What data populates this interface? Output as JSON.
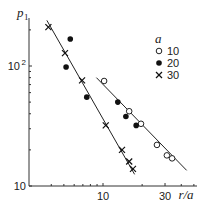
{
  "chart_data": {
    "type": "scatter",
    "title": "",
    "xlabel": "r/a",
    "ylabel": "p1",
    "xscale": "log",
    "yscale": "log",
    "xlim": [
      3.5,
      55
    ],
    "ylim": [
      10,
      250
    ],
    "x_ticks": [
      {
        "value": 10,
        "label": "10"
      },
      {
        "value": 30,
        "label": "30"
      }
    ],
    "x_minor_ticks": [
      4,
      5,
      6,
      7,
      8,
      9,
      20,
      40,
      50
    ],
    "y_ticks": [
      {
        "value": 10,
        "label": "10"
      },
      {
        "value": 100,
        "label": "10",
        "sup": "2"
      }
    ],
    "y_minor_ticks": [
      20,
      30,
      40,
      50,
      60,
      70,
      80,
      90,
      200
    ],
    "grid": false,
    "legend": {
      "title": "a",
      "position": "upper right",
      "entries": [
        {
          "label": "10",
          "marker": "open-circle"
        },
        {
          "label": "20",
          "marker": "filled-circle"
        },
        {
          "label": "30",
          "marker": "cross"
        }
      ]
    },
    "series": [
      {
        "name": "10",
        "marker": "open-circle",
        "points": [
          [
            10.2,
            75
          ],
          [
            15.9,
            42
          ],
          [
            19.6,
            33
          ],
          [
            26.0,
            22
          ],
          [
            31.0,
            18
          ],
          [
            34.0,
            17
          ]
        ]
      },
      {
        "name": "20",
        "marker": "filled-circle",
        "points": [
          [
            5.6,
            168
          ],
          [
            5.2,
            98
          ],
          [
            7.5,
            55
          ],
          [
            13.0,
            50
          ],
          [
            15.0,
            38
          ],
          [
            18.0,
            32
          ]
        ]
      },
      {
        "name": "30",
        "marker": "cross",
        "points": [
          [
            3.8,
            211
          ],
          [
            5.1,
            128
          ],
          [
            6.9,
            76
          ],
          [
            10.5,
            32
          ],
          [
            14.0,
            20
          ],
          [
            15.9,
            16
          ],
          [
            17.0,
            13.9
          ]
        ]
      }
    ],
    "fit_lines": [
      {
        "name": "left-fit",
        "from": [
          3.7,
          240
        ],
        "to": [
          17.5,
          12.5
        ]
      },
      {
        "name": "right-fit",
        "from": [
          8.9,
          80
        ],
        "to": [
          44,
          13.5
        ]
      }
    ]
  }
}
